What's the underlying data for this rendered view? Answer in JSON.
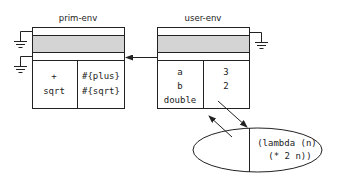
{
  "diagram": {
    "frames": [
      {
        "id": "prim-env",
        "title": "prim-env",
        "variables": [
          "+",
          "sqrt"
        ],
        "values": [
          "#{plus}",
          "#{sqrt}"
        ]
      },
      {
        "id": "user-env",
        "title": "user-env",
        "variables": [
          "a",
          "b",
          "double"
        ],
        "values": [
          "3",
          "2",
          ""
        ]
      }
    ],
    "procedure": {
      "code_line1": "(lambda (n)",
      "code_line2": "(* 2 n))"
    },
    "colors": {
      "stroke": "#222222",
      "shaded_band": "#d4d4d4",
      "background": "#ffffff"
    }
  }
}
